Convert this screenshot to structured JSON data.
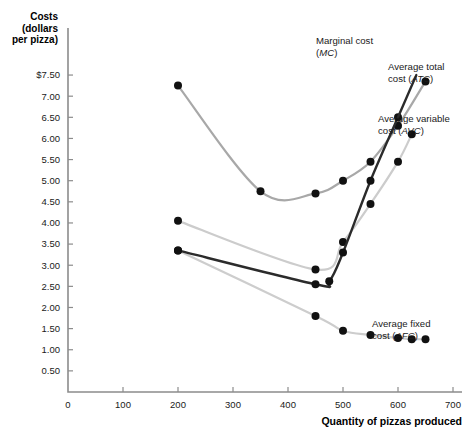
{
  "chart_data": {
    "type": "line",
    "title": "",
    "xlabel": "Quantity of pizzas produced",
    "ylabel": "Costs (dollars per pizza)",
    "ylabel_lines": [
      "Costs",
      "(dollars",
      "per pizza)"
    ],
    "xlim": [
      0,
      700
    ],
    "ylim": [
      0,
      7.75
    ],
    "grid": false,
    "legend_position": "inline-annotations",
    "xticks": [
      0,
      100,
      200,
      300,
      400,
      500,
      600,
      700
    ],
    "xtick_labels": [
      "0",
      "100",
      "200",
      "300",
      "400",
      "500",
      "600",
      "700"
    ],
    "yticks": [
      0.5,
      1.0,
      1.5,
      2.0,
      2.5,
      3.0,
      3.5,
      4.0,
      4.5,
      5.0,
      5.5,
      6.0,
      6.5,
      7.0,
      7.5
    ],
    "ytick_labels": [
      "0.50",
      "1.00",
      "1.50",
      "2.00",
      "2.50",
      "3.00",
      "3.50",
      "4.00",
      "4.50",
      "5.00",
      "5.50",
      "6.00",
      "6.50",
      "7.00",
      "$7.50"
    ],
    "y_origin_label": "0",
    "series": [
      {
        "name": "Marginal cost (MC)",
        "short": "MC",
        "color": "#2b2b2b",
        "label_lines": [
          "Marginal cost",
          "(MC)"
        ],
        "label_italic": "MC",
        "x": [
          200,
          450,
          475,
          500,
          550,
          600
        ],
        "y": [
          3.35,
          2.55,
          2.62,
          3.3,
          5.0,
          6.5
        ]
      },
      {
        "name": "Average total cost (ATC)",
        "short": "ATC",
        "color": "#a8a8a8",
        "label_lines": [
          "Average total",
          "cost (ATC)"
        ],
        "label_italic": "ATC",
        "x": [
          200,
          350,
          450,
          500,
          550,
          600,
          650
        ],
        "y": [
          7.25,
          4.75,
          4.7,
          5.0,
          5.45,
          6.3,
          7.35
        ]
      },
      {
        "name": "Average variable cost (AVC)",
        "short": "AVC",
        "color": "#cccccc",
        "label_lines": [
          "Average variable",
          "cost (AVC)"
        ],
        "label_italic": "AVC",
        "x": [
          200,
          450,
          500,
          550,
          600,
          625
        ],
        "y": [
          4.05,
          2.9,
          3.55,
          4.45,
          5.45,
          6.1
        ]
      },
      {
        "name": "Average fixed cost (AFC)",
        "short": "AFC",
        "color": "#cdcdcd",
        "label_lines": [
          "Average fixed",
          "cost (AFC)"
        ],
        "label_italic": "AFC",
        "x": [
          200,
          450,
          500,
          550,
          600,
          625,
          650
        ],
        "y": [
          3.35,
          1.8,
          1.45,
          1.35,
          1.28,
          1.25,
          1.25
        ]
      }
    ]
  }
}
